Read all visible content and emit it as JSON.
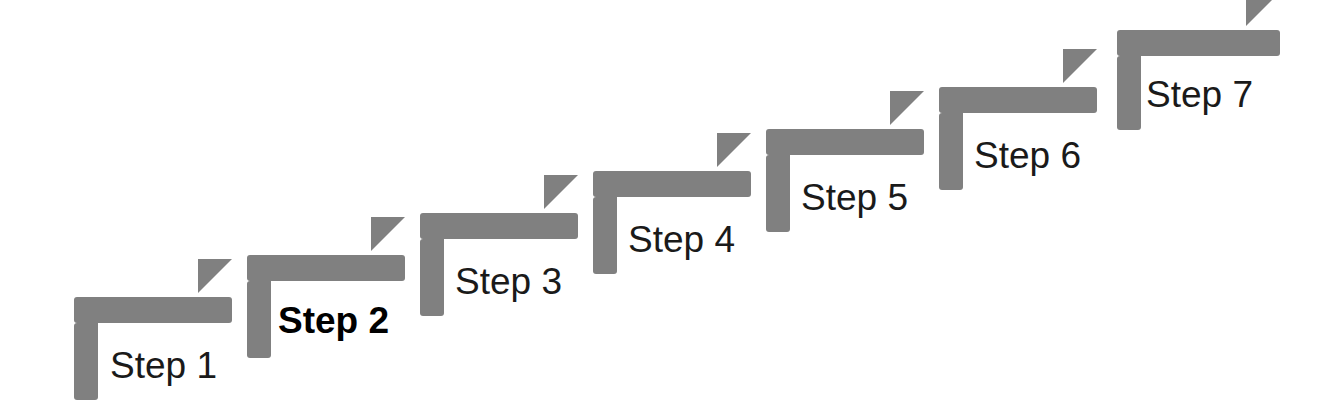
{
  "diagram": {
    "type": "staircase",
    "background_color": "#ffffff",
    "shape_color": "#808080",
    "label_color": "#1a1a1a",
    "highlight_label_color": "#000000",
    "canvas": {
      "width": 1343,
      "height": 418
    },
    "step_geometry": {
      "x_offset_per_step": 173,
      "y_offset_per_step": -42,
      "bar_height": 26,
      "bar_width": 158,
      "leg_width": 24,
      "leg_height": 103,
      "triangle_size": 34,
      "label_font_size": 37
    },
    "steps": [
      {
        "label": "Step 1",
        "index": 1,
        "highlighted": false,
        "shape_x": 74,
        "shape_y": 297,
        "bar_width": 158,
        "leg_height": 103,
        "label_x": 110,
        "label_y": 347
      },
      {
        "label": "Step 2",
        "index": 2,
        "highlighted": true,
        "shape_x": 247,
        "shape_y": 255,
        "bar_width": 158,
        "leg_height": 103,
        "label_x": 278,
        "label_y": 302
      },
      {
        "label": "Step 3",
        "index": 3,
        "highlighted": false,
        "shape_x": 420,
        "shape_y": 213,
        "bar_width": 158,
        "leg_height": 103,
        "label_x": 455,
        "label_y": 263
      },
      {
        "label": "Step 4",
        "index": 4,
        "highlighted": false,
        "shape_x": 593,
        "shape_y": 171,
        "bar_width": 158,
        "leg_height": 103,
        "label_x": 628,
        "label_y": 221
      },
      {
        "label": "Step 5",
        "index": 5,
        "highlighted": false,
        "shape_x": 766,
        "shape_y": 129,
        "bar_width": 158,
        "leg_height": 103,
        "label_x": 801,
        "label_y": 179
      },
      {
        "label": "Step 6",
        "index": 6,
        "highlighted": false,
        "shape_x": 939,
        "shape_y": 87,
        "bar_width": 158,
        "leg_height": 103,
        "label_x": 974,
        "label_y": 137
      },
      {
        "label": "Step 7",
        "index": 7,
        "highlighted": false,
        "shape_x": 1117,
        "shape_y": 30,
        "bar_width": 163,
        "leg_height": 100,
        "label_x": 1146,
        "label_y": 76
      }
    ]
  }
}
